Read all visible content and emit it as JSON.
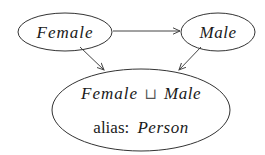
{
  "diagram": {
    "type": "concept-hierarchy",
    "nodes": [
      {
        "id": "female",
        "label": "Female",
        "italic": true
      },
      {
        "id": "male",
        "label": "Male",
        "italic": true
      },
      {
        "id": "union",
        "label_left": "Female",
        "operator": "⊔",
        "label_right": "Male",
        "alias_prefix": "alias:",
        "alias_value": "Person"
      }
    ],
    "edges": [
      {
        "from": "female",
        "to": "male"
      },
      {
        "from": "female",
        "to": "union"
      },
      {
        "from": "male",
        "to": "union"
      }
    ],
    "colors": {
      "stroke": "#333333",
      "text": "#1a1a1a",
      "background": "#ffffff"
    }
  }
}
